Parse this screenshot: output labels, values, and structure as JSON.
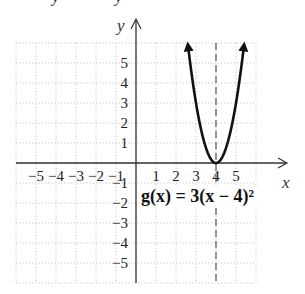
{
  "cropped_top_text": "             y              y",
  "chart_data": {
    "type": "line",
    "title": "",
    "function_label": "g(x) = 3(x − 4)²",
    "function": {
      "a": 3,
      "h": 4,
      "k": 0,
      "form": "g(x) = a(x - h)^2 + k"
    },
    "vertex": [
      4,
      0
    ],
    "axis_of_symmetry": {
      "x": 4,
      "style": "dashed"
    },
    "xlabel": "x",
    "ylabel": "y",
    "xlim": [
      -6,
      6
    ],
    "ylim": [
      -6,
      6
    ],
    "grid": true,
    "grid_style": "dotted",
    "x_ticks": [
      -5,
      -4,
      -3,
      -2,
      -1,
      1,
      2,
      3,
      4,
      5
    ],
    "y_ticks": [
      5,
      4,
      3,
      2,
      1,
      -1,
      -2,
      -3,
      -4,
      -5
    ],
    "x_tick_labels": [
      "−5",
      "−4",
      "−3",
      "−2",
      "−1",
      "1",
      "2",
      "3",
      "4",
      "5"
    ],
    "y_tick_labels": [
      "5",
      "4",
      "3",
      "2",
      "1",
      "−1",
      "−2",
      "−3",
      "−4",
      "−5"
    ],
    "series": [
      {
        "name": "g(x) = 3(x − 4)²",
        "x": [
          2.6,
          3.0,
          3.5,
          4.0,
          4.5,
          5.0,
          5.4
        ],
        "y": [
          5.88,
          3.0,
          0.75,
          0.0,
          0.75,
          3.0,
          5.88
        ],
        "arrows_at_ends": true
      }
    ]
  },
  "layout": {
    "origin_px": [
      136,
      163
    ],
    "unit_px": 20
  }
}
